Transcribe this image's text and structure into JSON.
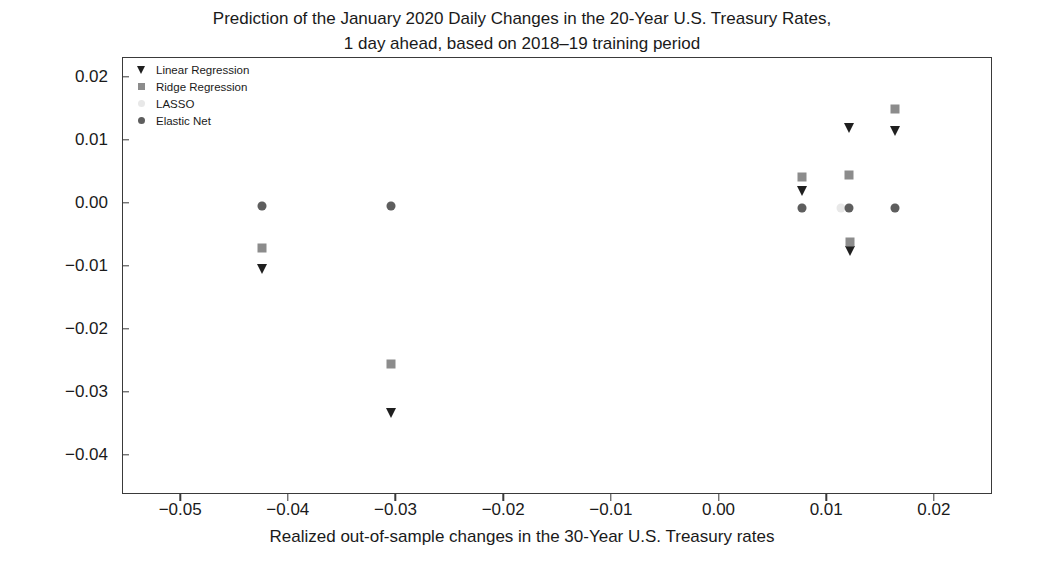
{
  "title": {
    "line1": "Prediction of the January 2020 Daily Changes in the 20-Year U.S. Treasury Rates,",
    "line2": "1 day ahead, based on 2018–19 training period"
  },
  "axes": {
    "xlabel": "Realized out-of-sample changes in the 30-Year U.S. Treasury rates",
    "ylabel": "",
    "xticks": [
      "−0.05",
      "−0.04",
      "−0.03",
      "−0.02",
      "−0.01",
      "0.00",
      "0.01",
      "0.02"
    ],
    "yticks": [
      "0.02",
      "0.01",
      "0.00",
      "−0.01",
      "−0.02",
      "−0.03",
      "−0.04"
    ],
    "xlim": [
      -0.0554,
      0.0254
    ],
    "ylim": [
      -0.0462,
      0.0231
    ],
    "grid": false
  },
  "legend": {
    "position": "upper-left-inside",
    "entries": [
      {
        "label": "Linear Regression",
        "marker": "triangle-down",
        "color": "#1f1f1f"
      },
      {
        "label": "Ridge Regression",
        "marker": "square",
        "color": "#8c8c8c"
      },
      {
        "label": "LASSO",
        "marker": "circle",
        "color": "#e8e8e8"
      },
      {
        "label": "Elastic Net",
        "marker": "circle",
        "color": "#5e5e5e"
      }
    ]
  },
  "chart_data": {
    "type": "scatter",
    "title": "Prediction of the January 2020 Daily Changes in the 20-Year U.S. Treasury Rates, 1 day ahead, based on 2018–19 training period",
    "xlabel": "Realized out-of-sample changes in the 30-Year U.S. Treasury rates",
    "ylabel": "",
    "xlim": [
      -0.0554,
      0.0254
    ],
    "ylim": [
      -0.0462,
      0.0231
    ],
    "grid": false,
    "series": [
      {
        "name": "Linear Regression",
        "marker": "triangle-down",
        "color": "#1f1f1f",
        "points": [
          {
            "x": -0.0424,
            "y": -0.0105
          },
          {
            "x": -0.0304,
            "y": -0.0333
          },
          {
            "x": 0.0078,
            "y": 0.0018
          },
          {
            "x": 0.0121,
            "y": 0.0118
          },
          {
            "x": 0.0122,
            "y": -0.0077
          },
          {
            "x": 0.0164,
            "y": 0.0113
          }
        ]
      },
      {
        "name": "Ridge Regression",
        "marker": "square",
        "color": "#8c8c8c",
        "points": [
          {
            "x": -0.0424,
            "y": -0.0072
          },
          {
            "x": -0.0304,
            "y": -0.0256
          },
          {
            "x": 0.0078,
            "y": 0.0041
          },
          {
            "x": 0.0121,
            "y": 0.0044
          },
          {
            "x": 0.0122,
            "y": -0.0062
          },
          {
            "x": 0.0164,
            "y": 0.0148
          }
        ]
      },
      {
        "name": "LASSO",
        "marker": "circle",
        "color": "#e8e8e8",
        "points": [
          {
            "x": -0.0424,
            "y": -0.0005
          },
          {
            "x": -0.0304,
            "y": -0.0005
          },
          {
            "x": 0.0078,
            "y": -0.0008
          },
          {
            "x": 0.0114,
            "y": -0.0008
          },
          {
            "x": 0.0164,
            "y": -0.0008
          }
        ]
      },
      {
        "name": "Elastic Net",
        "marker": "circle",
        "color": "#5e5e5e",
        "points": [
          {
            "x": -0.0424,
            "y": -0.0005
          },
          {
            "x": -0.0304,
            "y": -0.0005
          },
          {
            "x": 0.0078,
            "y": -0.0008
          },
          {
            "x": 0.0121,
            "y": -0.0008
          },
          {
            "x": 0.0164,
            "y": -0.0008
          }
        ]
      }
    ]
  }
}
